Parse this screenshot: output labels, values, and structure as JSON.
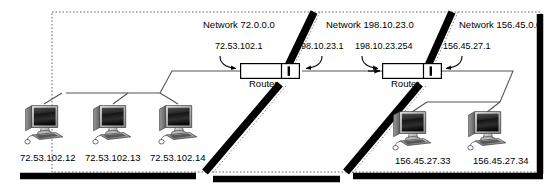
{
  "diagram": {
    "type": "network-topology",
    "colors": {
      "ink": "#000000",
      "line": "#555555",
      "boundary_bar": "#000000",
      "zone_border": "#666666",
      "screen_dark": "#1a1a1a"
    },
    "networks": [
      {
        "id": "net-72",
        "label": "Network 72.0.0.0"
      },
      {
        "id": "net-198",
        "label": "Network 198.10.23.0"
      },
      {
        "id": "net-156",
        "label": "Network 156.45.0.0"
      }
    ],
    "routers": [
      {
        "id": "router-1",
        "caption": "Router",
        "left_interface": "72.53.102.1",
        "right_interface": "198.10.23.1"
      },
      {
        "id": "router-2",
        "caption": "Router",
        "left_interface": "198.10.23.254",
        "right_interface": "156.45.27.1"
      }
    ],
    "hosts": [
      {
        "id": "host-1",
        "ip": "72.53.102.12",
        "network": "net-72"
      },
      {
        "id": "host-2",
        "ip": "72.53.102.13",
        "network": "net-72"
      },
      {
        "id": "host-3",
        "ip": "72.53.102.14",
        "network": "net-72"
      },
      {
        "id": "host-4",
        "ip": "156.45.27.33",
        "network": "net-156"
      },
      {
        "id": "host-5",
        "ip": "156.45.27.34",
        "network": "net-156"
      }
    ],
    "icons": {
      "computer": "computer-icon",
      "router": "router-icon",
      "arrow": "arrow-icon"
    }
  }
}
